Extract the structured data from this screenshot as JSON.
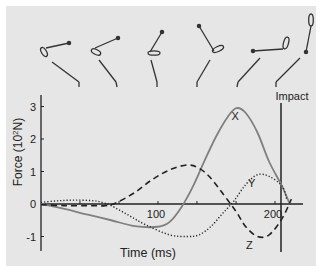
{
  "chart_data": {
    "type": "line",
    "title": "",
    "xlabel": "Time (ms)",
    "ylabel": "Force (10²N)",
    "ylabel_parts": {
      "main": "Force (10",
      "sup": "2",
      "unit": "N)"
    },
    "xlim": [
      0,
      225
    ],
    "ylim": [
      -1.4,
      3.4
    ],
    "yticks": [
      -1,
      0,
      1,
      2,
      3
    ],
    "ytick_labels": [
      "-1",
      "0",
      "1",
      "2",
      "3"
    ],
    "xtick_labels": [
      {
        "value": 100,
        "label": "100"
      },
      {
        "value": 200,
        "label": "200"
      }
    ],
    "grid": false,
    "legend": "inline curve labels",
    "annotations": [
      {
        "text": "Impact",
        "x": 206,
        "type": "vertical-line"
      },
      {
        "text": "X",
        "x": 166,
        "y": 2.7
      },
      {
        "text": "Y",
        "x": 180,
        "y": 0.65
      },
      {
        "text": "Z",
        "x": 178,
        "y": -1.25
      }
    ],
    "series": [
      {
        "name": "X",
        "style": "solid",
        "color": "#808080",
        "x": [
          0,
          20,
          40,
          60,
          80,
          100,
          110,
          120,
          130,
          140,
          150,
          160,
          167,
          175,
          185,
          195,
          206,
          212
        ],
        "y": [
          0,
          -0.15,
          -0.33,
          -0.5,
          -0.68,
          -0.7,
          -0.55,
          -0.1,
          0.55,
          1.35,
          2.1,
          2.7,
          2.95,
          2.8,
          2.2,
          1.3,
          0.55,
          0.05
        ]
      },
      {
        "name": "Y",
        "style": "dotted",
        "color": "#222222",
        "x": [
          0,
          15,
          30,
          45,
          52,
          60,
          75,
          90,
          110,
          125,
          135,
          145,
          155,
          165,
          175,
          185,
          195,
          206,
          210
        ],
        "y": [
          0.05,
          0.1,
          0.12,
          0.1,
          0.05,
          -0.05,
          -0.35,
          -0.65,
          -0.95,
          -1.0,
          -0.95,
          -0.7,
          -0.3,
          0.1,
          0.6,
          0.9,
          0.85,
          0.55,
          0.15
        ]
      },
      {
        "name": "Z",
        "style": "dashed",
        "color": "#222222",
        "x": [
          0,
          20,
          40,
          55,
          65,
          80,
          95,
          110,
          125,
          135,
          145,
          160,
          168,
          175,
          185,
          195,
          206,
          214
        ],
        "y": [
          -0.02,
          -0.05,
          -0.05,
          -0.05,
          0.05,
          0.35,
          0.75,
          1.05,
          1.2,
          1.1,
          0.8,
          0.1,
          -0.3,
          -0.7,
          -1.0,
          -0.95,
          -0.45,
          0.15
        ]
      }
    ]
  },
  "figures": {
    "caption": "Golf swing phases (stick figures)",
    "count": 6,
    "last_label": "Impact"
  }
}
